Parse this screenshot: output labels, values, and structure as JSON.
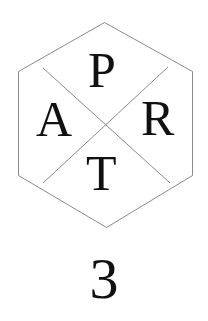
{
  "emblem": {
    "letters": {
      "top": "P",
      "left": "A",
      "right": "R",
      "bottom": "T"
    },
    "line_color": "#8a8a8a",
    "text_color": "#111111"
  },
  "part_number": "3"
}
